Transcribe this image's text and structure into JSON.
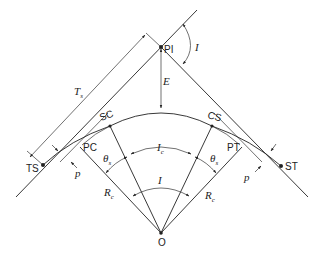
{
  "diagram": {
    "type": "spiral-curve-geometry",
    "points": {
      "PI": "PI",
      "TS": "TS",
      "SC": "SC",
      "CS": "CS",
      "ST": "ST",
      "PC": "PC",
      "PT": "PT",
      "O": "O"
    },
    "dimensions": {
      "Ts": "T",
      "Ts_sub": "s",
      "E": "E",
      "I_top": "I",
      "Ic": "I",
      "Ic_sub": "c",
      "I_center": "I",
      "theta_s_left": "θ",
      "theta_s_left_sub": "s",
      "theta_s_right": "θ",
      "theta_s_right_sub": "s",
      "Rc_left": "R",
      "Rc_left_sub": "c",
      "Rc_right": "R",
      "Rc_right_sub": "c",
      "p_left": "p",
      "p_right": "p"
    }
  }
}
